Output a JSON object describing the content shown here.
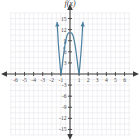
{
  "figure": {
    "function_label": "f(x)",
    "background": "#ffffff",
    "grid_color": "#e8e5ec",
    "axis_color": "#3d3d3d",
    "curve_color": "#4a7f9e",
    "label_color": "#4a4a4a"
  },
  "chart_data": {
    "type": "line",
    "title": "f(x)",
    "xlabel": "",
    "ylabel": "f(x)",
    "xlim": [
      -6.6,
      6.6
    ],
    "ylim": [
      -16.5,
      16.5
    ],
    "grid": true,
    "legend": "none",
    "x_ticks": [
      -6,
      -5,
      -4,
      -3,
      -2,
      -1,
      1,
      2,
      3,
      4,
      5,
      6
    ],
    "x_tick_labels": [
      "-6",
      "-5",
      "-4",
      "-3",
      "-2",
      "-1",
      "1",
      "2",
      "3",
      "4",
      "5",
      "6"
    ],
    "y_ticks": [
      15,
      12,
      9,
      6,
      3,
      -3,
      -6,
      -9,
      -12,
      -15
    ],
    "y_tick_labels": [
      "15",
      "12",
      "9",
      "6",
      "3",
      "-3",
      "-6",
      "-9",
      "-12",
      "-15"
    ],
    "x_grid_step": 0.5,
    "y_grid_step": 1.5,
    "series": [
      {
        "name": "f(x)",
        "description": "quartic, W-shaped, double roots at x = -1 and x = 1, local maximum near (0, 11)",
        "arrow_start": "up",
        "arrow_end": "up",
        "x": [
          -1.42,
          -1.35,
          -1.28,
          -1.2,
          -1.12,
          -1.05,
          -1.0,
          -0.95,
          -0.88,
          -0.8,
          -0.7,
          -0.6,
          -0.5,
          -0.4,
          -0.3,
          -0.2,
          -0.1,
          0.0,
          0.1,
          0.2,
          0.3,
          0.4,
          0.5,
          0.6,
          0.7,
          0.8,
          0.88,
          0.95,
          1.0,
          1.05,
          1.12,
          1.2,
          1.28,
          1.35,
          1.42
        ],
        "y": [
          14.0,
          11.2,
          8.2,
          5.6,
          3.2,
          1.2,
          0.0,
          0.55,
          1.8,
          3.5,
          5.4,
          7.2,
          8.6,
          9.8,
          10.6,
          11.0,
          11.15,
          11.2,
          11.15,
          11.0,
          10.6,
          9.8,
          8.6,
          7.2,
          5.4,
          3.5,
          1.8,
          0.55,
          0.0,
          1.2,
          3.2,
          5.6,
          8.2,
          11.2,
          14.0
        ]
      }
    ],
    "markers": [
      {
        "x": -0.62,
        "y": 7.0,
        "label": ""
      },
      {
        "x": -0.52,
        "y": 8.4,
        "label": ""
      }
    ]
  }
}
